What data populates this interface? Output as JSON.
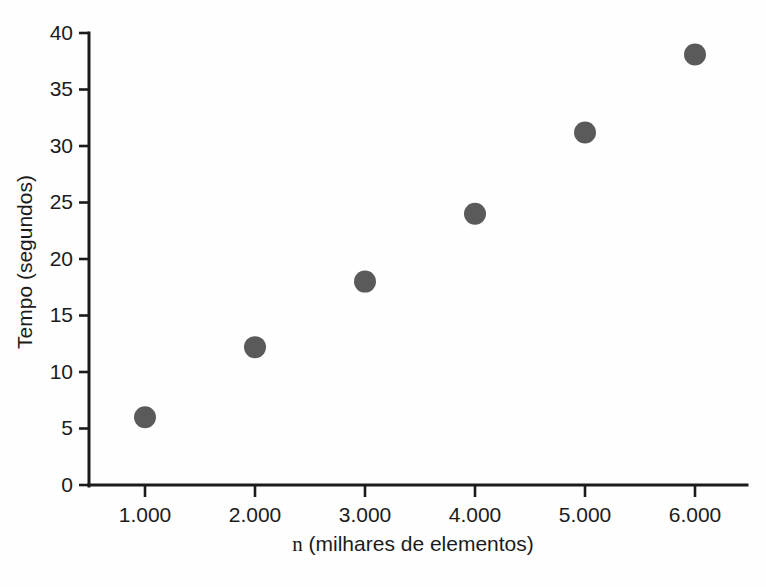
{
  "chart_data": {
    "type": "scatter",
    "title": "",
    "xlabel": "n (milhares de elementos)",
    "ylabel": "Tempo (segundos)",
    "x": [
      1000,
      2000,
      3000,
      4000,
      5000,
      6000
    ],
    "values": [
      6.0,
      12.2,
      18.0,
      24.0,
      31.2,
      38.1
    ],
    "points": [
      {
        "x": 1000,
        "y": 6.0,
        "x_label": "1.000"
      },
      {
        "x": 2000,
        "y": 12.2,
        "x_label": "2.000"
      },
      {
        "x": 3000,
        "y": 18.0,
        "x_label": "3.000"
      },
      {
        "x": 4000,
        "y": 24.0,
        "x_label": "4.000"
      },
      {
        "x": 5000,
        "y": 31.2,
        "x_label": "5.000"
      },
      {
        "x": 6000,
        "y": 38.1,
        "x_label": "6.000"
      }
    ],
    "xticks": [
      1000,
      2000,
      3000,
      4000,
      5000,
      6000
    ],
    "xtick_labels": [
      "1.000",
      "2.000",
      "3.000",
      "4.000",
      "5.000",
      "6.000"
    ],
    "yticks": [
      0,
      5,
      10,
      15,
      20,
      25,
      30,
      35,
      40
    ],
    "ytick_labels": [
      "0",
      "5",
      "10",
      "15",
      "20",
      "25",
      "30",
      "35",
      "40"
    ],
    "xlim": [
      500,
      6500
    ],
    "ylim": [
      0,
      40
    ],
    "grid": false,
    "legend": null,
    "marker_color": "#5a5a5a",
    "axis_color": "#1b1b1b",
    "background_color": "#fefefe"
  },
  "figure": {
    "xlabel_text": "n (milhares de elementos)",
    "ylabel_text": "Tempo (segundos)"
  }
}
